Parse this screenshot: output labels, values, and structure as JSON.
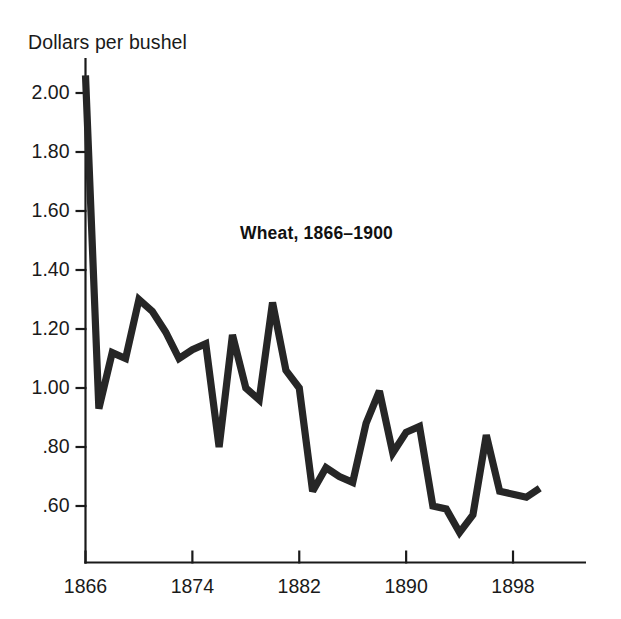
{
  "axis_caption": "Dollars per bushel",
  "chart_data": {
    "type": "line",
    "title": "Wheat, 1866–1900",
    "subtitle": "",
    "xlabel": "",
    "ylabel": "Dollars per bushel",
    "ylim": [
      0.4,
      2.12
    ],
    "xlim": [
      1866,
      1902
    ],
    "grid": false,
    "legend": "none",
    "line_color": "#262626",
    "x_tick_labels": [
      "1866",
      "1874",
      "1882",
      "1890",
      "1898"
    ],
    "x_tick_values": [
      1866,
      1874,
      1882,
      1890,
      1898
    ],
    "y_tick_labels": [
      "2.00",
      "1.80",
      "1.60",
      "1.40",
      "1.20",
      "1.00",
      ".80",
      ".60"
    ],
    "y_tick_values": [
      2.0,
      1.8,
      1.6,
      1.4,
      1.2,
      1.0,
      0.8,
      0.6
    ],
    "x": [
      1866,
      1867,
      1868,
      1869,
      1870,
      1871,
      1872,
      1873,
      1874,
      1875,
      1876,
      1877,
      1878,
      1879,
      1880,
      1881,
      1882,
      1883,
      1884,
      1885,
      1886,
      1887,
      1888,
      1889,
      1890,
      1891,
      1892,
      1893,
      1894,
      1895,
      1896,
      1897,
      1898,
      1899,
      1900
    ],
    "values": [
      2.06,
      0.93,
      1.12,
      1.1,
      1.3,
      1.26,
      1.19,
      1.1,
      1.13,
      1.15,
      0.8,
      1.18,
      1.0,
      0.96,
      1.29,
      1.06,
      1.0,
      0.65,
      0.73,
      0.7,
      0.68,
      0.88,
      0.99,
      0.78,
      0.85,
      0.87,
      0.6,
      0.59,
      0.51,
      0.57,
      0.84,
      0.65,
      0.64,
      0.63,
      0.66
    ],
    "series": [
      {
        "name": "Wheat price",
        "unit": "dollars per bushel",
        "values": [
          2.06,
          0.93,
          1.12,
          1.1,
          1.3,
          1.26,
          1.19,
          1.1,
          1.13,
          1.15,
          0.8,
          1.18,
          1.0,
          0.96,
          1.29,
          1.06,
          1.0,
          0.65,
          0.73,
          0.7,
          0.68,
          0.88,
          0.99,
          0.78,
          0.85,
          0.87,
          0.6,
          0.59,
          0.51,
          0.57,
          0.84,
          0.65,
          0.64,
          0.63,
          0.66
        ]
      }
    ]
  }
}
